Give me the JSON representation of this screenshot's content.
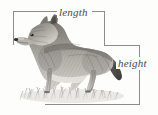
{
  "figure": {
    "kind": "labeled-illustration",
    "style": "grayscale pencil engraving",
    "background_color": "#fdfdfc",
    "rule_color": "#8d8d8d",
    "label_color": "#4a4a4a"
  },
  "labels": {
    "length": "length",
    "height": "height"
  },
  "measurement_rules": {
    "top_horizontal": {
      "x": 13,
      "y": 11,
      "width": 91
    },
    "left_vertical": {
      "x": 13,
      "y": 11,
      "height": 34
    },
    "mid_horizontal": {
      "x": 104,
      "y": 45,
      "width": 36
    },
    "upper_right_vertical": {
      "x": 104,
      "y": 11,
      "height": 34
    },
    "right_vertical_upper": {
      "x": 139,
      "y": 45,
      "height": 12
    },
    "right_vertical_lower": {
      "x": 139,
      "y": 70,
      "height": 34
    },
    "bottom_horizontal": {
      "x": 45,
      "y": 104,
      "width": 95
    }
  },
  "illustration": {
    "parts": [
      "head",
      "ear",
      "muzzle",
      "neck",
      "body",
      "foreleg",
      "hindleg",
      "tail",
      "grass"
    ],
    "ground_cover": "grass tufts"
  }
}
